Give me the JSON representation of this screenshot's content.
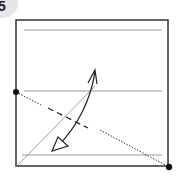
{
  "step": {
    "number": "5",
    "badge_color": "#e6e6e6",
    "text_color": "#222222"
  },
  "paper": {
    "edge_color": "#333333",
    "crease_color": "#9a9a9a",
    "square": {
      "x": 16,
      "y": 20,
      "size": 152
    }
  },
  "lines": {
    "creases": [
      {
        "x1": 24,
        "y1": 30,
        "x2": 162,
        "y2": 30
      },
      {
        "x1": 24,
        "y1": 91,
        "x2": 162,
        "y2": 91
      },
      {
        "x1": 22,
        "y1": 155,
        "x2": 162,
        "y2": 155
      }
    ],
    "diagonal_crease": {
      "x1": 17,
      "y1": 166,
      "x2": 95,
      "y2": 86
    },
    "valley_fold": {
      "x1": 48,
      "y1": 108,
      "x2": 88,
      "y2": 128
    },
    "reference_dotted": {
      "x1": 16,
      "y1": 92,
      "x2": 169,
      "y2": 167
    }
  },
  "points": [
    {
      "label": "left-edge-point",
      "x": 16,
      "y": 92
    },
    {
      "label": "bottom-right-corner-point",
      "x": 169,
      "y": 167
    }
  ],
  "arrow": {
    "type": "fold-and-unfold",
    "start": {
      "x": 95,
      "y": 70
    },
    "end": {
      "x": 53,
      "y": 150
    }
  }
}
